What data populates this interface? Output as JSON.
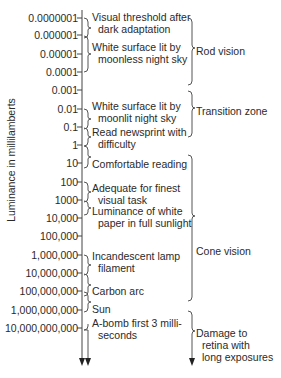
{
  "diagram": {
    "y_axis_label": "Luminance in millilamberts",
    "ticks": [
      {
        "label": "0.0000001",
        "y": 18
      },
      {
        "label": "0.000001",
        "y": 35
      },
      {
        "label": "0.00001",
        "y": 54
      },
      {
        "label": "0.0001",
        "y": 72
      },
      {
        "label": "0.001",
        "y": 90
      },
      {
        "label": "0.01",
        "y": 109
      },
      {
        "label": "0.1",
        "y": 127
      },
      {
        "label": "1",
        "y": 145
      },
      {
        "label": "10",
        "y": 163
      },
      {
        "label": "100",
        "y": 182
      },
      {
        "label": "1000",
        "y": 200
      },
      {
        "label": "10,000",
        "y": 218
      },
      {
        "label": "100,000",
        "y": 236
      },
      {
        "label": "1,000,000",
        "y": 255
      },
      {
        "label": "10,000,000",
        "y": 273
      },
      {
        "label": "100,000,000",
        "y": 291
      },
      {
        "label": "1,000,000,000",
        "y": 310
      },
      {
        "label": "10,000,000,000",
        "y": 328
      }
    ],
    "descriptions": [
      {
        "line1": "Visual threshold after",
        "line2": "dark adaptation",
        "top": 12
      },
      {
        "line1": "White surface lit by",
        "line2": "moonless night sky",
        "top": 42
      },
      {
        "line1": "White surface lit by",
        "line2": "moonlit night sky",
        "top": 97
      },
      {
        "line1": "Read newsprint with",
        "line2": "difficulty",
        "top": 126
      },
      {
        "line1": "Comfortable reading",
        "line2": "",
        "top": 157
      },
      {
        "line1": "Adequate for finest",
        "line2": "visual task",
        "top": 180
      },
      {
        "line1": "Luminance of white",
        "line2": "paper in full sunlight",
        "top": 206
      },
      {
        "line1": "Incandescent lamp",
        "line2": "filament",
        "top": 247
      },
      {
        "line1": "Carbon arc",
        "line2": "",
        "top": 285
      },
      {
        "line1": "Sun",
        "line2": "",
        "top": 303
      },
      {
        "line1": "A-bomb first 3 milli-",
        "line2": "seconds",
        "top": 318
      }
    ],
    "zones": [
      {
        "line1": "Rod vision",
        "line2": "",
        "line3": "",
        "top": 45
      },
      {
        "line1": "Transition zone",
        "line2": "",
        "line3": "",
        "top": 104
      },
      {
        "line1": "Cone vision",
        "line2": "",
        "line3": "",
        "top": 245
      },
      {
        "line1": "Damage to",
        "line2": "retina with",
        "line3": "long exposures",
        "top": 327
      }
    ]
  }
}
